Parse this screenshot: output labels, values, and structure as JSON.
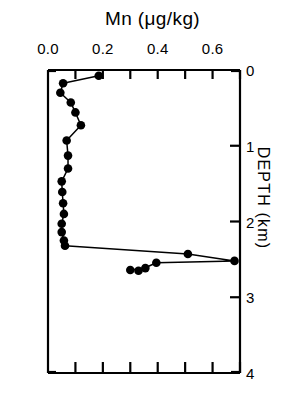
{
  "figure": {
    "title": "Mn (μg/kg)",
    "axis_label_depth": "DEPTH (km)"
  },
  "chart_data": {
    "type": "scatter",
    "title": "Mn (μg/kg)",
    "subtitle": "",
    "xlabel": "Mn (μg/kg)",
    "ylabel": "DEPTH (km)",
    "xlim": [
      0.0,
      0.7
    ],
    "ylim": [
      0,
      4
    ],
    "y_inverted": true,
    "grid": false,
    "legend": null,
    "marker": "filled-circle",
    "line": "connected",
    "x_ticks_major": [
      0.0,
      0.2,
      0.4,
      0.6
    ],
    "x_tick_labels": [
      "0.0",
      "0.2",
      "0.4",
      "0.6"
    ],
    "x_ticks_minor_step": 0.1,
    "y_ticks_major": [
      0,
      1,
      2,
      3,
      4
    ],
    "y_tick_labels": [
      "0",
      "1",
      "2",
      "3",
      "4"
    ],
    "series": [
      {
        "name": "Mn profile",
        "x": [
          0.185,
          0.055,
          0.045,
          0.083,
          0.1,
          0.12,
          0.068,
          0.073,
          0.073,
          0.05,
          0.052,
          0.055,
          0.058,
          0.05,
          0.05,
          0.058,
          0.062,
          0.51,
          0.68,
          0.395,
          0.33,
          0.355,
          0.3
        ],
        "y": [
          0.075,
          0.175,
          0.3,
          0.43,
          0.56,
          0.73,
          0.93,
          1.13,
          1.3,
          1.47,
          1.61,
          1.76,
          1.9,
          2.03,
          2.14,
          2.25,
          2.32,
          2.43,
          2.52,
          2.545,
          2.65,
          2.615,
          2.64
        ]
      }
    ]
  }
}
